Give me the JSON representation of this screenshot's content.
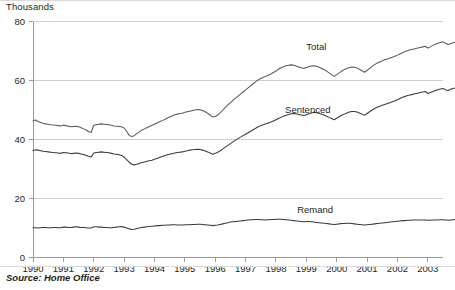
{
  "axis_unit_label": "Thousands",
  "source_note": "Source: Home Office",
  "y_ticks": [
    "0",
    "20",
    "40",
    "60",
    "80"
  ],
  "x_ticks": [
    "1990",
    "1991",
    "1992",
    "1993",
    "1994",
    "1995",
    "1996",
    "1997",
    "1998",
    "1999",
    "2000",
    "2001",
    "2002",
    "2003"
  ],
  "series_labels": {
    "total": "Total",
    "sentenced": "Sentenced",
    "remand": "Remand"
  },
  "colors": {
    "total_line": "#5a5a5a",
    "sentenced_line": "#3a3a3a",
    "remand_line": "#3a3a3a",
    "gridline": "#d0d0d0",
    "axis": "#9a9a9a",
    "text": "#231f20",
    "background": "#ffffff"
  },
  "chart_data": {
    "type": "line",
    "title": "",
    "subtitle": "",
    "xlabel": "",
    "ylabel": "Thousands",
    "ylim": [
      0,
      80
    ],
    "xlim": [
      1990,
      2003.5
    ],
    "grid": true,
    "legend": "inline-annotations",
    "x_tick_values": [
      1990,
      1991,
      1992,
      1993,
      1994,
      1995,
      1996,
      1997,
      1998,
      1999,
      2000,
      2001,
      2002,
      2003
    ],
    "y_tick_values": [
      0,
      20,
      40,
      60,
      80
    ],
    "x_step_months": 0.08333,
    "series": [
      {
        "name": "Total",
        "label_x": 1999.0,
        "label_y": 71.5,
        "values": [
          46.3,
          46.6,
          46.1,
          45.8,
          45.5,
          45.3,
          45.2,
          45.0,
          44.9,
          44.8,
          44.7,
          44.6,
          44.9,
          44.7,
          44.5,
          44.3,
          44.4,
          44.5,
          44.3,
          44.0,
          43.6,
          43.2,
          42.7,
          42.4,
          44.8,
          45.0,
          45.2,
          45.3,
          45.2,
          45.1,
          45.0,
          44.8,
          44.6,
          44.5,
          44.4,
          44.3,
          43.9,
          42.8,
          41.4,
          41.0,
          41.3,
          42.0,
          42.6,
          43.2,
          43.6,
          44.0,
          44.4,
          44.8,
          45.2,
          45.6,
          46.0,
          46.4,
          46.8,
          47.2,
          47.6,
          48.0,
          48.4,
          48.6,
          48.8,
          48.9,
          49.2,
          49.4,
          49.6,
          49.8,
          50.0,
          50.2,
          50.1,
          49.8,
          49.4,
          48.9,
          48.3,
          47.6,
          47.8,
          48.3,
          49.1,
          50.0,
          50.9,
          51.7,
          52.5,
          53.3,
          54.0,
          54.7,
          55.4,
          56.1,
          56.8,
          57.5,
          58.2,
          58.9,
          59.6,
          60.2,
          60.7,
          61.1,
          61.4,
          61.8,
          62.2,
          62.7,
          63.2,
          63.8,
          64.3,
          64.7,
          65.0,
          65.2,
          65.3,
          65.2,
          64.9,
          64.6,
          64.3,
          64.1,
          64.4,
          64.7,
          64.9,
          65.0,
          64.8,
          64.5,
          64.1,
          63.7,
          63.2,
          62.6,
          62.0,
          61.4,
          62.0,
          62.6,
          63.2,
          63.7,
          64.1,
          64.4,
          64.6,
          64.5,
          64.2,
          63.8,
          63.3,
          62.8,
          63.4,
          64.1,
          64.8,
          65.4,
          65.9,
          66.3,
          66.7,
          67.0,
          67.3,
          67.6,
          67.9,
          68.2,
          68.6,
          69.0,
          69.4,
          69.8,
          70.1,
          70.4,
          70.6,
          70.8,
          71.0,
          71.2,
          71.4,
          71.6,
          71.0,
          71.4,
          71.9,
          72.3,
          72.6,
          72.9,
          73.1,
          72.6,
          72.2,
          72.5,
          72.8,
          73.0
        ]
      },
      {
        "name": "Sentenced",
        "label_x": 1998.3,
        "label_y": 50.0,
        "values": [
          36.2,
          36.5,
          36.4,
          36.2,
          36.0,
          35.9,
          35.8,
          35.7,
          35.6,
          35.5,
          35.4,
          35.3,
          35.6,
          35.5,
          35.4,
          35.2,
          35.3,
          35.4,
          35.3,
          35.1,
          34.9,
          34.6,
          34.3,
          34.1,
          35.4,
          35.6,
          35.7,
          35.8,
          35.7,
          35.6,
          35.5,
          35.3,
          35.1,
          35.0,
          34.8,
          34.6,
          34.0,
          33.2,
          32.3,
          31.6,
          31.4,
          31.6,
          31.9,
          32.2,
          32.4,
          32.6,
          32.8,
          33.0,
          33.3,
          33.6,
          33.9,
          34.2,
          34.5,
          34.8,
          35.0,
          35.2,
          35.4,
          35.6,
          35.7,
          35.8,
          36.0,
          36.2,
          36.4,
          36.5,
          36.6,
          36.7,
          36.6,
          36.4,
          36.1,
          35.8,
          35.4,
          35.0,
          35.3,
          35.7,
          36.2,
          36.8,
          37.4,
          38.0,
          38.6,
          39.2,
          39.8,
          40.3,
          40.8,
          41.3,
          41.8,
          42.3,
          42.8,
          43.3,
          43.8,
          44.3,
          44.7,
          45.0,
          45.3,
          45.6,
          45.9,
          46.3,
          46.7,
          47.1,
          47.5,
          47.9,
          48.2,
          48.5,
          48.7,
          48.8,
          48.7,
          48.5,
          48.3,
          48.1,
          48.4,
          48.7,
          49.0,
          49.2,
          49.1,
          48.9,
          48.6,
          48.3,
          47.9,
          47.5,
          47.1,
          46.7,
          47.2,
          47.7,
          48.2,
          48.6,
          49.0,
          49.3,
          49.5,
          49.5,
          49.3,
          49.0,
          48.6,
          48.2,
          48.8,
          49.4,
          50.0,
          50.5,
          50.9,
          51.3,
          51.6,
          51.9,
          52.2,
          52.5,
          52.8,
          53.1,
          53.5,
          53.9,
          54.3,
          54.6,
          54.9,
          55.1,
          55.3,
          55.5,
          55.7,
          55.9,
          56.1,
          56.3,
          55.6,
          55.9,
          56.3,
          56.6,
          56.9,
          57.1,
          57.3,
          56.9,
          56.6,
          57.0,
          57.3,
          57.5
        ]
      },
      {
        "name": "Remand",
        "label_x": 1998.7,
        "label_y": 16.0,
        "values": [
          10.1,
          10.1,
          10.0,
          10.1,
          10.2,
          10.2,
          10.1,
          10.1,
          10.2,
          10.2,
          10.1,
          10.1,
          10.3,
          10.3,
          10.2,
          10.2,
          10.3,
          10.4,
          10.3,
          10.2,
          10.2,
          10.1,
          10.0,
          10.0,
          10.4,
          10.4,
          10.3,
          10.3,
          10.2,
          10.2,
          10.1,
          10.1,
          10.2,
          10.3,
          10.4,
          10.5,
          10.3,
          10.0,
          9.7,
          9.5,
          9.6,
          9.8,
          10.0,
          10.2,
          10.3,
          10.4,
          10.5,
          10.6,
          10.7,
          10.8,
          10.8,
          10.9,
          10.9,
          11.0,
          11.0,
          11.1,
          11.1,
          11.0,
          11.0,
          11.0,
          11.1,
          11.1,
          11.1,
          11.2,
          11.2,
          11.3,
          11.3,
          11.2,
          11.1,
          11.0,
          10.9,
          10.8,
          10.9,
          11.0,
          11.2,
          11.4,
          11.6,
          11.8,
          12.0,
          12.1,
          12.2,
          12.3,
          12.4,
          12.5,
          12.6,
          12.7,
          12.8,
          12.8,
          12.9,
          12.9,
          12.8,
          12.8,
          12.7,
          12.8,
          12.9,
          12.9,
          13.0,
          13.0,
          13.0,
          12.9,
          12.8,
          12.7,
          12.6,
          12.5,
          12.4,
          12.3,
          12.2,
          12.1,
          12.2,
          12.2,
          12.1,
          12.0,
          11.9,
          11.8,
          11.7,
          11.6,
          11.5,
          11.4,
          11.3,
          11.2,
          11.3,
          11.4,
          11.5,
          11.5,
          11.6,
          11.6,
          11.5,
          11.4,
          11.3,
          11.2,
          11.1,
          11.0,
          11.1,
          11.2,
          11.3,
          11.4,
          11.5,
          11.6,
          11.7,
          11.8,
          11.9,
          12.0,
          12.1,
          12.2,
          12.3,
          12.4,
          12.5,
          12.5,
          12.6,
          12.6,
          12.7,
          12.7,
          12.7,
          12.7,
          12.7,
          12.7,
          12.6,
          12.6,
          12.7,
          12.7,
          12.7,
          12.8,
          12.8,
          12.7,
          12.6,
          12.7,
          12.8,
          12.9
        ]
      }
    ]
  }
}
